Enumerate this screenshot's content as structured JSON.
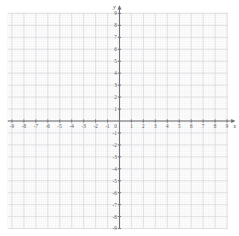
{
  "chart_data": {
    "type": "scatter",
    "title": "",
    "subtitle": "",
    "xlabel": "x",
    "ylabel": "y",
    "xlim": [
      -9.6,
      9.9
    ],
    "ylim": [
      -9.3,
      9.8
    ],
    "grid": true,
    "minor_grid": true,
    "minor_subdivisions": 5,
    "legend": "none",
    "series": [],
    "x_ticks": [
      -9,
      -8,
      -7,
      -6,
      -5,
      -4,
      -3,
      -2,
      -1,
      1,
      2,
      3,
      4,
      5,
      6,
      7,
      8,
      9
    ],
    "y_ticks": [
      9,
      8,
      7,
      6,
      5,
      4,
      3,
      2,
      1,
      -1,
      -2,
      -3,
      -4,
      -5,
      -6,
      -7,
      -8,
      -9
    ],
    "x_tick_labels": [
      "-9",
      "-8",
      "-7",
      "-6",
      "-5",
      "-4",
      "-3",
      "-2",
      "-1",
      "1",
      "2",
      "3",
      "4",
      "5",
      "6",
      "7",
      "8",
      "9"
    ],
    "y_tick_labels": [
      "9",
      "8",
      "7",
      "6",
      "5",
      "4",
      "3",
      "2",
      "1",
      "-1",
      "-2",
      "-3",
      "-4",
      "-5",
      "-6",
      "-7",
      "-8",
      "-9"
    ],
    "origin_label": "0",
    "axis_arrows": [
      "x-positive",
      "y-positive"
    ],
    "colors": {
      "background": "#ffffff",
      "major_grid": "#d6d6da",
      "minor_grid": "#f0f0f2",
      "axis": "#6e6e73",
      "tick_label": "#58585c",
      "axis_name": "#3f3f43"
    }
  },
  "graph": {
    "x_axis_name": "x",
    "y_axis_name": "y",
    "origin_label": "0"
  }
}
